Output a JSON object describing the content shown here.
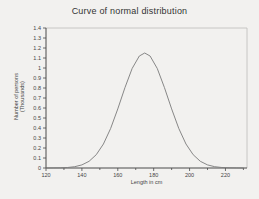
{
  "title": "Curve of normal distribution",
  "ylabel_line1": "Number of persons",
  "ylabel_line2": "(Thousands)",
  "chart_data": {
    "type": "line",
    "title": "Curve of normal distribution",
    "xlabel": "Length in cm",
    "ylabel": "Number of persons (Thousands)",
    "xlim": [
      120,
      232
    ],
    "ylim": [
      0,
      1.4
    ],
    "grid": false,
    "legend": "none",
    "x_major_ticks": [
      120,
      140,
      160,
      180,
      200,
      220
    ],
    "x_minor_ticks": [
      130,
      150,
      170,
      190,
      210,
      230
    ],
    "y_ticks": [
      0,
      0.1,
      0.2,
      0.3,
      0.4,
      0.5,
      0.6,
      0.7,
      0.8,
      0.9,
      1,
      1.1,
      1.2,
      1.3,
      1.4
    ],
    "y_tick_labels": [
      "0",
      "0.1",
      "0.2",
      "0.3",
      "0.4",
      "0.5",
      "0.6",
      "0.7",
      "0.8",
      "0.9",
      "1",
      "1.1",
      "1.2",
      "1.3",
      "1.4"
    ],
    "distribution": {
      "shape": "gaussian",
      "mean_cm": 175,
      "sigma_cm": 13,
      "peak_thousands": 1.15
    },
    "x": [
      120,
      124,
      128,
      132,
      136,
      140,
      144,
      148,
      152,
      156,
      160,
      164,
      168,
      172,
      175,
      178,
      182,
      186,
      190,
      194,
      198,
      202,
      206,
      210,
      214,
      218,
      222,
      226,
      230
    ],
    "y": [
      0.0,
      0.001,
      0.002,
      0.005,
      0.013,
      0.031,
      0.067,
      0.133,
      0.24,
      0.395,
      0.591,
      0.804,
      0.995,
      1.12,
      1.15,
      1.12,
      0.995,
      0.804,
      0.591,
      0.395,
      0.24,
      0.133,
      0.067,
      0.031,
      0.013,
      0.005,
      0.002,
      0.001,
      0.0
    ],
    "colors": {
      "curve": "#7a7a7a",
      "axis": "#4a4a4a",
      "box_border": "#bcbcba",
      "tick_text": "#444444",
      "background": "#f2f1ef"
    }
  }
}
